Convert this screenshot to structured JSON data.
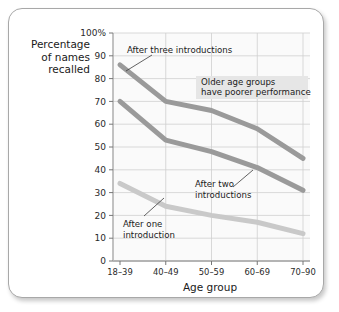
{
  "chart_data": {
    "type": "line",
    "title": "",
    "xlabel": "Age group",
    "ylabel": "Percentage of names recalled",
    "ylabel_lines": [
      "Percentage",
      "of names",
      "recalled"
    ],
    "categories": [
      "18–39",
      "40–49",
      "50–59",
      "60–69",
      "70–90"
    ],
    "ylim": [
      0,
      100
    ],
    "ytick_labels": [
      "0",
      "10",
      "20",
      "30",
      "40",
      "50",
      "60",
      "70",
      "80",
      "90",
      "100%"
    ],
    "ytick_values": [
      0,
      10,
      20,
      30,
      40,
      50,
      60,
      70,
      80,
      90,
      100
    ],
    "grid": true,
    "legend_position": "inline-annotations",
    "series": [
      {
        "name": "After three introductions",
        "values": [
          86,
          70,
          66,
          58,
          45
        ],
        "color": "#9a9a9a"
      },
      {
        "name": "After two introductions",
        "values": [
          70,
          53,
          48,
          41,
          31
        ],
        "color": "#9a9a9a"
      },
      {
        "name": "After one introduction",
        "values": [
          34,
          24,
          20,
          17,
          12
        ],
        "color": "#c9c9c9"
      }
    ],
    "annotations": [
      {
        "id": "after-three-introductions",
        "text": "After three introductions",
        "lines": [
          "After three introductions"
        ]
      },
      {
        "id": "older-age-groups",
        "text": "Older age groups have poorer performance",
        "lines": [
          "Older age groups",
          "have poorer performance"
        ],
        "background": "#e6e6e6"
      },
      {
        "id": "after-two-introductions",
        "text": "After two introductions",
        "lines": [
          "After two",
          "introductions"
        ]
      },
      {
        "id": "after-one-introduction",
        "text": "After one introduction",
        "lines": [
          "After one",
          "introduction"
        ]
      }
    ]
  },
  "colors": {
    "frame_border": "#a8a8a8",
    "plot_background": "#fafafa",
    "gridline": "#cfcfcf",
    "axis": "#9a9a9a",
    "dark_line": "#9a9a9a",
    "light_line": "#c9c9c9",
    "text": "#1a1a1a",
    "callout_background": "#e6e6e6"
  }
}
